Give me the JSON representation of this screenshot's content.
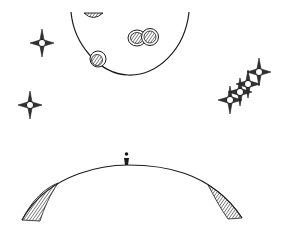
{
  "scene": {
    "title": "Sketch of a small figure standing on a planet horizon beneath a cratered moon and sparkling stars",
    "style": "hand-drawn ink sketch",
    "colors": {
      "background": "#ffffff",
      "ink": "#1a1a1a",
      "shade": "#555555"
    },
    "elements": {
      "moon": {
        "label": "moon",
        "crater_count": 4
      },
      "stars": {
        "label": "four-point star",
        "count": 6
      },
      "planet": {
        "label": "planet horizon"
      },
      "figure": {
        "label": "small standing figure"
      }
    }
  }
}
